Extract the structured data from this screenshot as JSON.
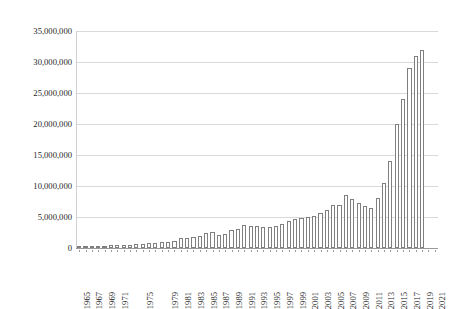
{
  "chart_data": {
    "type": "bar",
    "title": "",
    "subtitle": "",
    "xlabel": "",
    "ylabel": "",
    "ylim": [
      0,
      35000000
    ],
    "ytick_values": [
      0,
      5000000,
      10000000,
      15000000,
      20000000,
      25000000,
      30000000,
      35000000
    ],
    "ytick_labels": [
      "0",
      "5,000,000",
      "10,000,000",
      "15,000,000",
      "20,000,000",
      "25,000,000",
      "30,000,000",
      "35,000,000"
    ],
    "grid": true,
    "legend": "none",
    "xtick_labels": [
      "1965",
      "1967",
      "1969",
      "1971",
      "1975",
      "1979",
      "1981",
      "1983",
      "1985",
      "1987",
      "1989",
      "1991",
      "1993",
      "1995",
      "1997",
      "1999",
      "2001",
      "2003",
      "2005",
      "2007",
      "2009",
      "2011",
      "2013",
      "2015",
      "2017",
      "2019",
      "2021"
    ],
    "categories": [
      "1965",
      "1966",
      "1967",
      "1968",
      "1969",
      "1970",
      "1971",
      "1972",
      "1973",
      "1974",
      "1975",
      "1976",
      "1977",
      "1978",
      "1979",
      "1980",
      "1981",
      "1982",
      "1983",
      "1984",
      "1985",
      "1986",
      "1987",
      "1988",
      "1989",
      "1990",
      "1991",
      "1992",
      "1993",
      "1994",
      "1995",
      "1996",
      "1997",
      "1998",
      "1999",
      "2000",
      "2001",
      "2002",
      "2003",
      "2004",
      "2005",
      "2006",
      "2007",
      "2008",
      "2009",
      "2010",
      "2011",
      "2012",
      "2013",
      "2014",
      "2015",
      "2016",
      "2017",
      "2018",
      "2019",
      "2020",
      "2021"
    ],
    "values": [
      250000,
      260000,
      300000,
      320000,
      380000,
      420000,
      470000,
      520000,
      560000,
      620000,
      700000,
      760000,
      830000,
      900000,
      1000000,
      1150000,
      1550000,
      1650000,
      1800000,
      2000000,
      2500000,
      2550000,
      2100000,
      2200000,
      2900000,
      3000000,
      3700000,
      3500000,
      3500000,
      3400000,
      3400000,
      3600000,
      3800000,
      4300000,
      4600000,
      4800000,
      5000000,
      5100000,
      5600000,
      6100000,
      6900000,
      7000000,
      8500000,
      7900000,
      7200000,
      6800000,
      6400000,
      8000000,
      10500000,
      14000000,
      20000000,
      24000000,
      29000000,
      31000000,
      32000000,
      0,
      0
    ],
    "bar_style": {
      "fill": "#ffffff",
      "edge": "#7f7f7f"
    },
    "background": "#ffffff",
    "gridline_color": "#d9d9d9"
  }
}
